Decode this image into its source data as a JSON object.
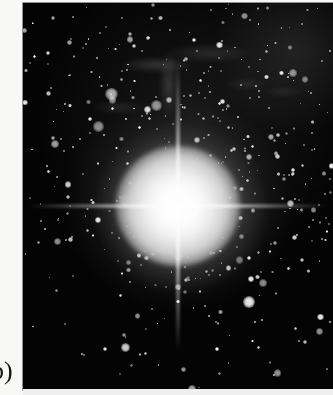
{
  "figure": {
    "panel_label": "b)",
    "caption_text": "",
    "image_type": "astronomical photographic plate",
    "colors": {
      "page_background": "#f8f8f7",
      "plate_background": "#050505",
      "star_white": "#ffffff",
      "label_ink": "#171717",
      "plate_foot": "#efefef"
    },
    "plate": {
      "left": 23,
      "top": 3,
      "width": 310,
      "height": 387,
      "core_center_x_pct": 50,
      "core_center_y_pct": 52.5,
      "has_diffraction_spikes": true,
      "spike_count": 2,
      "spike_orientations": [
        "vertical",
        "horizontal"
      ]
    },
    "features": [
      {
        "name": "bright-central-core",
        "description": "saturated white core at image centre"
      },
      {
        "name": "vertical-diffraction-spike",
        "description": "vertical spike through the core"
      },
      {
        "name": "horizontal-diffraction-spike",
        "description": "horizontal spike through the core"
      },
      {
        "name": "nebular-filaments",
        "description": "wispy grey filaments in the upper third"
      },
      {
        "name": "bright-star-clump-upper-right",
        "description": "bright blended knot near the top right corner"
      },
      {
        "name": "sparse-field-lower-left",
        "description": "sparse resolved stars on black sky in the lower left"
      }
    ]
  }
}
